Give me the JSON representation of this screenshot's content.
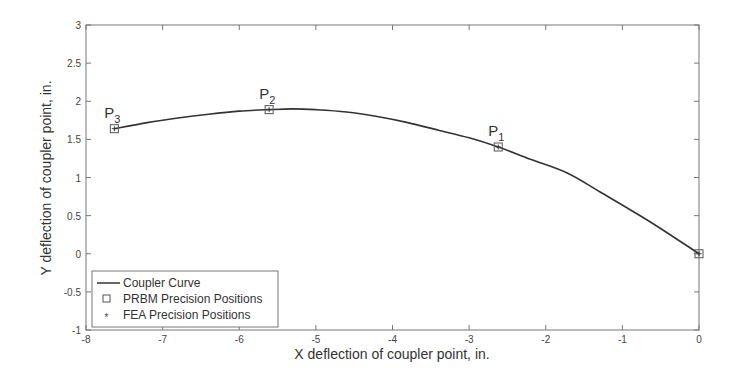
{
  "chart_data": {
    "type": "line",
    "title": "",
    "xlabel": "X deflection of coupler point, in.",
    "ylabel": "Y deflection of coupler point, in.",
    "xlim": [
      -8,
      0
    ],
    "ylim": [
      -1,
      3
    ],
    "xticks": [
      -8,
      -7,
      -6,
      -5,
      -4,
      -3,
      -2,
      -1,
      0
    ],
    "yticks": [
      -1,
      -0.5,
      0,
      0.5,
      1,
      1.5,
      2,
      2.5,
      3
    ],
    "grid": false,
    "legend_position": "lower left",
    "series": [
      {
        "name": "Coupler Curve",
        "style": "solid line",
        "x": [
          -7.63,
          -7.2,
          -6.8,
          -6.4,
          -6.0,
          -5.61,
          -5.3,
          -5.0,
          -4.6,
          -4.2,
          -3.8,
          -3.4,
          -3.0,
          -2.62,
          -2.2,
          -1.72,
          -1.29,
          -0.64,
          0.0
        ],
        "y": [
          1.64,
          1.72,
          1.78,
          1.83,
          1.87,
          1.89,
          1.9,
          1.89,
          1.86,
          1.8,
          1.72,
          1.62,
          1.52,
          1.4,
          1.24,
          1.06,
          0.81,
          0.42,
          0.0
        ]
      },
      {
        "name": "PRBM Precision Positions",
        "style": "square marker",
        "x": [
          -2.62,
          -5.61,
          -7.63,
          0.0
        ],
        "y": [
          1.4,
          1.89,
          1.64,
          0.0
        ]
      },
      {
        "name": "FEA Precision Positions",
        "style": "asterisk marker",
        "x": [
          -2.62,
          -5.61,
          -7.63,
          0.0
        ],
        "y": [
          1.4,
          1.89,
          1.64,
          0.0
        ]
      }
    ],
    "annotations": [
      {
        "text": "P",
        "sub": "1",
        "x": -2.62,
        "y": 1.4
      },
      {
        "text": "P",
        "sub": "2",
        "x": -5.61,
        "y": 1.89
      },
      {
        "text": "P",
        "sub": "3",
        "x": -7.63,
        "y": 1.64
      }
    ],
    "colors": {
      "line": "#333333",
      "frame": "#777777",
      "marker": "#555555"
    }
  },
  "legend": {
    "items": [
      {
        "label": "Coupler Curve"
      },
      {
        "label": "PRBM Precision Positions"
      },
      {
        "label": "FEA Precision Positions"
      }
    ]
  }
}
